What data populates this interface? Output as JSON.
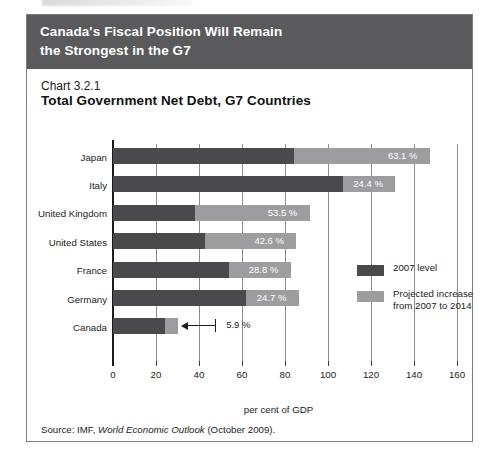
{
  "header": {
    "line1": "Canada's Fiscal Position Will Remain",
    "line2": "the Strongest in the G7",
    "bg": "#5a5a5c",
    "text_color": "#ffffff"
  },
  "chart_label": "Chart 3.2.1",
  "chart_title": "Total Government Net Debt, G7 Countries",
  "legend": {
    "items": [
      {
        "label": "2007 level",
        "color": "#4a4a4c",
        "swatch": "dark-swatch"
      },
      {
        "label": "Projected increase\nfrom 2007 to 2014",
        "label_line1": "Projected increase",
        "label_line2": "from 2007 to 2014",
        "color": "#9d9d9f",
        "swatch": "light-swatch"
      }
    ]
  },
  "source": {
    "prefix": "Source: IMF,",
    "italic": "World Economic Outlook",
    "suffix": "(October 2009)."
  },
  "chart_data": {
    "type": "bar",
    "orientation": "horizontal",
    "stacked": true,
    "title": "Total Government Net Debt, G7 Countries",
    "subtitle": "Chart 3.2.1",
    "xlabel": "per cent of GDP",
    "ylabel": "",
    "xlim": [
      0,
      160
    ],
    "xticks": [
      0,
      20,
      40,
      60,
      80,
      100,
      120,
      140,
      160
    ],
    "xtick_labels": [
      "0",
      "20",
      "40",
      "60",
      "80",
      "100",
      "120",
      "140",
      "160"
    ],
    "grid": true,
    "grid_axis": "x",
    "legend_position": "center-right",
    "categories": [
      "Japan",
      "Italy",
      "United Kingdom",
      "United States",
      "France",
      "Germany",
      "Canada"
    ],
    "series": [
      {
        "name": "2007 level",
        "color": "#4a4a4c",
        "values": [
          84.3,
          106.9,
          38.0,
          42.7,
          53.9,
          61.7,
          24.4
        ]
      },
      {
        "name": "Projected increase from 2007 to 2014",
        "color": "#9d9d9f",
        "values": [
          63.1,
          24.4,
          53.5,
          42.6,
          28.8,
          24.7,
          5.9
        ]
      }
    ],
    "data_labels": [
      "63.1 %",
      "24.4 %",
      "53.5 %",
      "42.6 %",
      "28.8 %",
      "24.7 %",
      "5.9 %"
    ],
    "annotation": {
      "category": "Canada",
      "label": "5.9 %",
      "style": "arrow-callout"
    }
  }
}
